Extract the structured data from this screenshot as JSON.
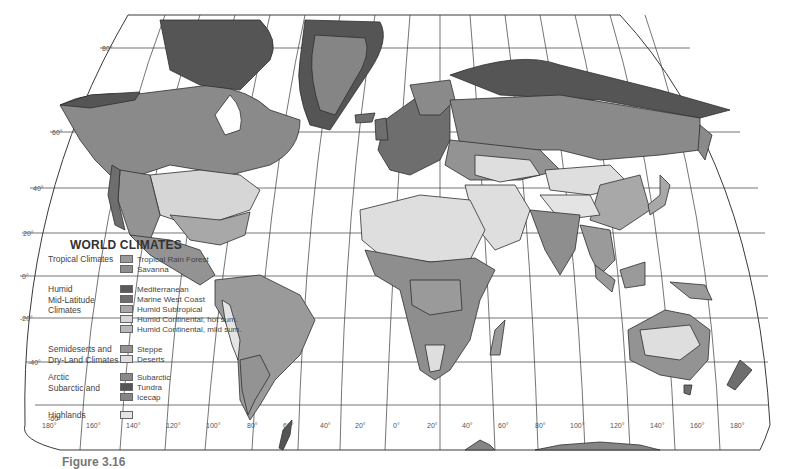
{
  "legend": {
    "title": "WORLD CLIMATES",
    "groups": [
      {
        "label": "Tropical Climates",
        "items": [
          {
            "label": "Tropical Rain Forest",
            "color": "#9a9a9a"
          },
          {
            "label": "Savanna",
            "color": "#8e8e8e"
          }
        ]
      },
      {
        "label": "Humid\nMid-Latitude\nClimates",
        "items": [
          {
            "label": "Mediterranean",
            "color": "#5a5a5a"
          },
          {
            "label": "Marine West Coast",
            "color": "#6e6e6e"
          },
          {
            "label": "Humid Subtropical",
            "color": "#a8a8a8"
          },
          {
            "label": "Humid Continental, hot sum.",
            "color": "#d6d6d6"
          },
          {
            "label": "Humid Continental, mild sum.",
            "color": "#b8b8b8"
          }
        ]
      },
      {
        "label": "Semideserts and\nDry-Land Climates",
        "items": [
          {
            "label": "Steppe",
            "color": "#939393"
          },
          {
            "label": "Deserts",
            "color": "#dedede"
          }
        ]
      },
      {
        "label": "Arctic\nSubarctic and",
        "items": [
          {
            "label": "Subarctic",
            "color": "#8a8a8a"
          },
          {
            "label": "Tundra",
            "color": "#555555"
          },
          {
            "label": "Icecap",
            "color": "#858585"
          }
        ]
      },
      {
        "label": "Highlands",
        "items": [
          {
            "label": "",
            "color": "#e4e4e4"
          }
        ]
      }
    ]
  },
  "graticule": {
    "latitudes": [
      "80°",
      "60°",
      "40°",
      "20°",
      "0°",
      "-20°",
      "-40°",
      "-60°"
    ],
    "longitudes": [
      "180°",
      "160°",
      "140°",
      "120°",
      "100°",
      "80°",
      "60°",
      "40°",
      "20°",
      "0°",
      "20°",
      "40°",
      "60°",
      "80°",
      "100°",
      "120°",
      "140°",
      "160°",
      "180°"
    ]
  },
  "caption": "Figure 3.16",
  "colors": {
    "land_outline": "#2e2e2e",
    "grid": "#3a3a3a",
    "background": "#ffffff"
  }
}
